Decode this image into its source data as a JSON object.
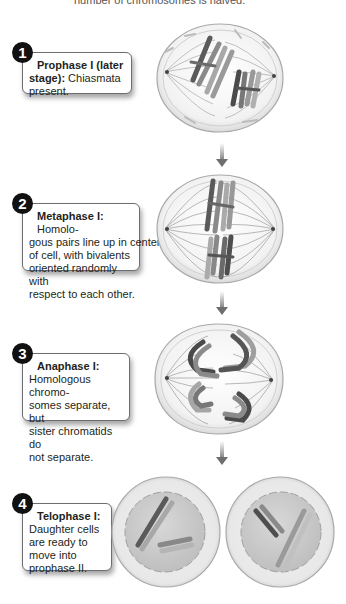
{
  "caption": "number of chromosomes is halved.",
  "stages": [
    {
      "number": "1",
      "title": "Prophase I (later stage):",
      "title_line1": "Prophase I (later",
      "title_line2": "stage):",
      "text": "Chiasmata present.",
      "text_inline": " Chiasmata",
      "text_rest": "present."
    },
    {
      "number": "2",
      "title": "Metaphase I:",
      "text": "Homologous pairs line up in center of cell, with bivalents oriented randomly with respect to each other.",
      "text_inline": " Homolo-",
      "lines": [
        "gous pairs line up in center",
        "of cell, with bivalents",
        "oriented randomly with",
        "respect to each other."
      ]
    },
    {
      "number": "3",
      "title": "Anaphase I:",
      "text": "Homologous chromosomes separate, but sister chromatids do not separate.",
      "lines": [
        "Homologous chromo-",
        "somes separate, but",
        "sister chromatids do",
        "not separate."
      ]
    },
    {
      "number": "4",
      "title": "Telophase I:",
      "text": "Daughter cells are ready to move into prophase II.",
      "lines": [
        "Daughter cells",
        "are ready to",
        "move into",
        "prophase II."
      ]
    }
  ],
  "colors": {
    "cell_fill": "#e6e6e6",
    "cell_border": "#a7a9ac",
    "chromosome_dark": "#5a5a5a",
    "chromosome_light": "#a0a0a0",
    "spindle": "#8c8c8c",
    "nucleus_fill": "#c8c8c8"
  }
}
